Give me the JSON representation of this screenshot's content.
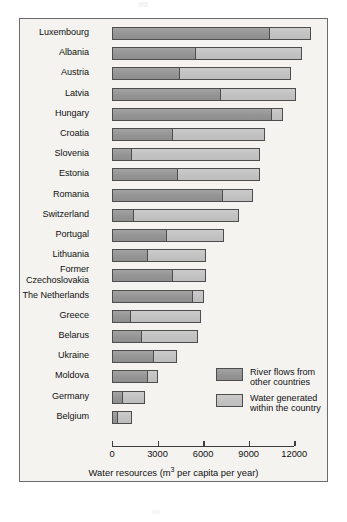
{
  "chart_data": {
    "type": "bar",
    "orientation": "horizontal",
    "stacked": true,
    "title": "",
    "xlabel": "Water resources (m3 per capita per year)",
    "xlabel_parts": {
      "before": "Water resources (m",
      "sup": "3",
      "after": " per capita per year)"
    },
    "ylabel": "",
    "xlim": [
      0,
      13500
    ],
    "axis_max_tick": 12000,
    "ticks": [
      0,
      3000,
      6000,
      9000,
      12000
    ],
    "tick_labels": [
      "0",
      "3000",
      "6000",
      "9000",
      "12000"
    ],
    "grid": false,
    "legend_position": "inside-right-lower",
    "categories": [
      "Luxembourg",
      "Albania",
      "Austria",
      "Latvia",
      "Hungary",
      "Croatia",
      "Slovenia",
      "Estonia",
      "Romania",
      "Switzerland",
      "Portugal",
      "Lithuania",
      "Former\nCzechoslovakia",
      "The Netherlands",
      "Greece",
      "Belarus",
      "Ukraine",
      "Moldova",
      "Germany",
      "Belgium"
    ],
    "series": [
      {
        "name": "River flows from other countries",
        "color": "#9a9a9a",
        "values": [
          10400,
          5500,
          4500,
          7150,
          10550,
          4000,
          1300,
          4350,
          7300,
          1450,
          3600,
          2350,
          4000,
          5350,
          1250,
          1950,
          2750,
          2400,
          700,
          400
        ]
      },
      {
        "name": "Water generated within the country",
        "color": "#c4c4c4",
        "values": [
          2700,
          7000,
          7300,
          4950,
          700,
          6100,
          8450,
          5400,
          2000,
          6900,
          3750,
          3850,
          2200,
          700,
          4600,
          3700,
          1550,
          600,
          1450,
          950
        ]
      }
    ],
    "totals": [
      13100,
      12500,
      11800,
      12100,
      11250,
      10100,
      9750,
      9750,
      9300,
      8350,
      7350,
      6200,
      6200,
      6050,
      5850,
      5650,
      4300,
      3000,
      2150,
      1350
    ]
  },
  "legend": {
    "items": [
      {
        "label": "River flows from\nother countries",
        "swatch": "dark"
      },
      {
        "label": "Water generated\nwithin the country",
        "swatch": "light"
      }
    ]
  },
  "colors": {
    "series_dark": "#9a9a9a",
    "series_light": "#c4c4c4",
    "outline": "#4d4d4d",
    "frame": "#6b6b6b",
    "panel_background": "#f4f3f0",
    "text": "#111111"
  }
}
